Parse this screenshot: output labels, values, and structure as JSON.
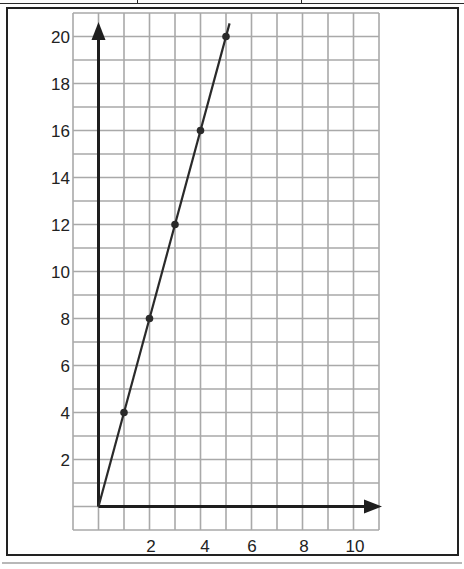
{
  "chart_data": {
    "type": "line",
    "title": "",
    "xlabel": "",
    "ylabel": "",
    "x": [
      1,
      2,
      3,
      4,
      5
    ],
    "series": [
      {
        "name": "y = 4x",
        "values": [
          4,
          8,
          12,
          16,
          20
        ],
        "markers": true,
        "line_through_origin": true
      }
    ],
    "x_tick_labels": [
      "2",
      "4",
      "6",
      "8",
      "10"
    ],
    "y_tick_labels": [
      "2",
      "4",
      "6",
      "8",
      "10",
      "12",
      "14",
      "16",
      "18",
      "20"
    ],
    "xlim": [
      -1,
      11
    ],
    "ylim": [
      -1,
      21
    ],
    "grid": true,
    "legend": "none",
    "axis_arrows": true
  },
  "colors": {
    "grid": "#a9a9a9",
    "axis": "#1e1e1e",
    "line": "#2a2a2a",
    "frame": "#222222",
    "text": "#222222"
  }
}
